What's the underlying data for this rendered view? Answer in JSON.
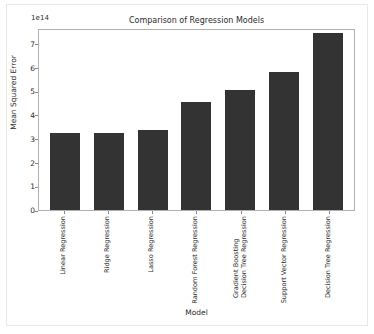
{
  "chart_data": {
    "type": "bar",
    "title": "Comparison of Regression Models",
    "xlabel": "Model",
    "ylabel": "Mean Squared Error",
    "y_offset_text": "1e14",
    "y_scale": 100000000000000.0,
    "ylim": [
      0,
      7.65
    ],
    "grid": false,
    "legend": null,
    "bar_color": "#333333",
    "axes_color": "#b0b0b0",
    "categories": [
      "Linear Regression",
      "Ridge Regression",
      "Lasso Regression",
      "Random Forest Regression",
      "Gradient Boosting\nDecision Tree Regression",
      "Support Vector Regression",
      "Decision Tree Regression"
    ],
    "values": [
      3.24,
      3.22,
      3.38,
      4.55,
      5.05,
      5.8,
      7.42
    ],
    "ytick_labels": [
      "0",
      "1",
      "2",
      "3",
      "4",
      "5",
      "6",
      "7"
    ],
    "ytick_values": [
      0,
      1,
      2,
      3,
      4,
      5,
      6,
      7
    ]
  }
}
